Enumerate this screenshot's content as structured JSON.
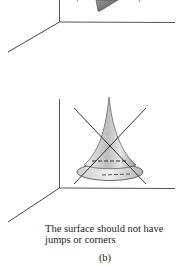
{
  "caption": {
    "line1": "The surface should not have",
    "line2": "jumps or corners"
  },
  "panel_label": "(b)",
  "colors": {
    "axis": "#555555",
    "shape_dark": "#777777",
    "cone_fill": "#d8d8d8",
    "cross": "#333333"
  }
}
